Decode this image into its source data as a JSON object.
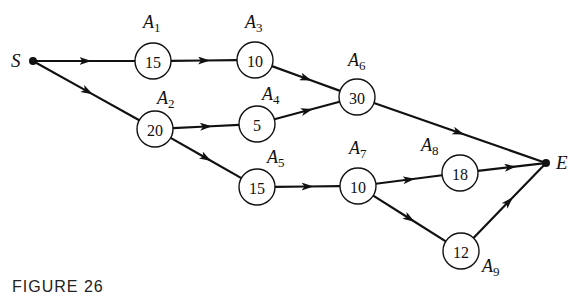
{
  "diagram": {
    "type": "activity-network",
    "start": {
      "label": "S",
      "x": 33,
      "y": 61
    },
    "end": {
      "label": "E",
      "x": 546,
      "y": 163
    },
    "nodes": [
      {
        "id": "A1",
        "name": "A",
        "sub": "1",
        "value": "15",
        "x": 153,
        "y": 61,
        "lx": 143,
        "ly": 28
      },
      {
        "id": "A2",
        "name": "A",
        "sub": "2",
        "value": "20",
        "x": 155,
        "y": 129,
        "lx": 157,
        "ly": 104
      },
      {
        "id": "A3",
        "name": "A",
        "sub": "3",
        "value": "10",
        "x": 255,
        "y": 60,
        "lx": 245,
        "ly": 28
      },
      {
        "id": "A4",
        "name": "A",
        "sub": "4",
        "value": "5",
        "x": 257,
        "y": 124,
        "lx": 262,
        "ly": 100
      },
      {
        "id": "A5",
        "name": "A",
        "sub": "5",
        "value": "15",
        "x": 257,
        "y": 187,
        "lx": 267,
        "ly": 163
      },
      {
        "id": "A6",
        "name": "A",
        "sub": "6",
        "value": "30",
        "x": 357,
        "y": 97,
        "lx": 348,
        "ly": 66
      },
      {
        "id": "A7",
        "name": "A",
        "sub": "7",
        "value": "10",
        "x": 358,
        "y": 186,
        "lx": 349,
        "ly": 154
      },
      {
        "id": "A8",
        "name": "A",
        "sub": "8",
        "value": "18",
        "x": 460,
        "y": 173,
        "lx": 421,
        "ly": 151
      },
      {
        "id": "A9",
        "name": "A",
        "sub": "9",
        "value": "12",
        "x": 461,
        "y": 251,
        "lx": 482,
        "ly": 272
      }
    ],
    "edges": [
      [
        "S",
        "A1"
      ],
      [
        "S",
        "A2"
      ],
      [
        "A1",
        "A3"
      ],
      [
        "A3",
        "A6"
      ],
      [
        "A2",
        "A4"
      ],
      [
        "A4",
        "A6"
      ],
      [
        "A2",
        "A5"
      ],
      [
        "A6",
        "E"
      ],
      [
        "A5",
        "A7"
      ],
      [
        "A7",
        "A8"
      ],
      [
        "A7",
        "A9"
      ],
      [
        "A8",
        "E"
      ],
      [
        "A9",
        "E"
      ]
    ]
  },
  "caption": "FIGURE 26"
}
